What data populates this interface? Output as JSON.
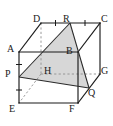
{
  "figure": {
    "type": "geometry-diagram",
    "background_color": "#ffffff",
    "line_color": "#1a1a1a",
    "hidden_line_color": "#8a8a8a",
    "shade_fill": "#c9c9c9",
    "shade_opacity": "0.75",
    "width": 113,
    "height": 126,
    "labels": {
      "A": "A",
      "B": "B",
      "C": "C",
      "D": "D",
      "E": "E",
      "F": "F",
      "G": "G",
      "H": "H",
      "P": "P",
      "Q": "Q",
      "R": "R"
    },
    "label_positions": {
      "A": {
        "x": 7,
        "y": 44
      },
      "B": {
        "x": 66,
        "y": 46
      },
      "C": {
        "x": 101,
        "y": 14
      },
      "D": {
        "x": 33,
        "y": 14
      },
      "E": {
        "x": 9,
        "y": 104
      },
      "F": {
        "x": 69,
        "y": 104
      },
      "G": {
        "x": 101,
        "y": 66
      },
      "H": {
        "x": 44,
        "y": 66
      },
      "P": {
        "x": 5,
        "y": 69
      },
      "Q": {
        "x": 88,
        "y": 88
      },
      "R": {
        "x": 63,
        "y": 14
      }
    },
    "vertices": {
      "A": {
        "x": 19,
        "y": 52
      },
      "B": {
        "x": 78,
        "y": 52
      },
      "C": {
        "x": 100,
        "y": 23
      },
      "D": {
        "x": 41,
        "y": 23
      },
      "E": {
        "x": 19,
        "y": 103
      },
      "F": {
        "x": 78,
        "y": 103
      },
      "G": {
        "x": 100,
        "y": 74
      },
      "H": {
        "x": 41,
        "y": 74
      },
      "P": {
        "x": 19,
        "y": 77
      },
      "Q": {
        "x": 89,
        "y": 88
      },
      "R": {
        "x": 70,
        "y": 23
      }
    },
    "shaded_polygon": [
      "P",
      "R",
      "Q"
    ],
    "tick_marks": [
      {
        "segment": "DR",
        "count": 1
      },
      {
        "segment": "RC",
        "count": 1
      },
      {
        "segment": "AP",
        "count": 1
      },
      {
        "segment": "PE",
        "count": 1
      }
    ],
    "hidden_edges": [
      "DH",
      "HE",
      "HG"
    ],
    "solid_edges": [
      "AB",
      "BF",
      "FE",
      "EA",
      "DC",
      "CG",
      "AD",
      "BC",
      "FG"
    ]
  }
}
